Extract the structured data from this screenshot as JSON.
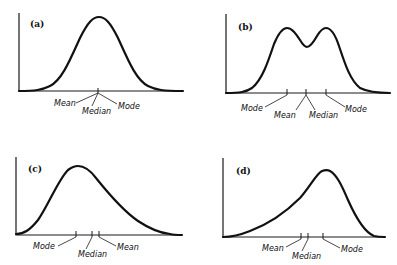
{
  "panels": [
    {
      "id": "a",
      "label": "(a)",
      "shape": "symmetric unimodal",
      "labels": {
        "mean": "Mean",
        "median": "Median",
        "mode": "Mode"
      }
    },
    {
      "id": "b",
      "label": "(b)",
      "shape": "symmetric bimodal",
      "labels": {
        "mode_left": "Mode",
        "mean": "Mean",
        "median": "Median",
        "mode_right": "Mode"
      }
    },
    {
      "id": "c",
      "label": "(c)",
      "shape": "positively (right) skewed",
      "labels": {
        "mode": "Mode",
        "median": "Median",
        "mean": "Mean"
      }
    },
    {
      "id": "d",
      "label": "(d)",
      "shape": "negatively (left) skewed",
      "labels": {
        "mean": "Mean",
        "median": "Median",
        "mode": "Mode"
      }
    }
  ]
}
